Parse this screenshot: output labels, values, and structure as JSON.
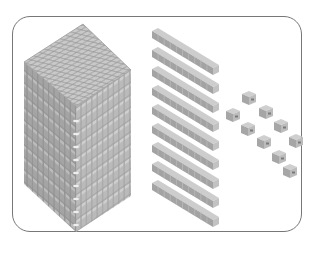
{
  "figure": {
    "thousand_block": {
      "flats": 10,
      "grid": "10x10"
    },
    "rods": {
      "count": 10,
      "units_per_rod": 10
    },
    "units": {
      "count": 9
    },
    "colors": {
      "border": "#777777",
      "block_top": "#c8c8c8",
      "block_left": "#a9a9a9",
      "block_right": "#bdbdbd",
      "grid_line": "#8e8e8e"
    }
  }
}
